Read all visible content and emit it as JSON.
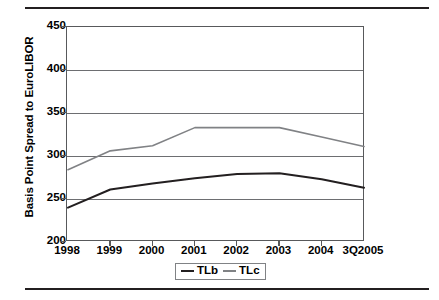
{
  "chart_data": {
    "type": "line",
    "title": "",
    "xlabel": "",
    "ylabel": "Basis Point Spread to EuroLIBOR",
    "categories": [
      "1998",
      "1999",
      "2000",
      "2001",
      "2002",
      "2003",
      "2004",
      "3Q2005"
    ],
    "yticks": [
      200,
      250,
      300,
      350,
      400,
      450
    ],
    "ylim": [
      200,
      450
    ],
    "grid": true,
    "legend_position": "bottom-center",
    "series": [
      {
        "name": "TLb",
        "color": "#231f20",
        "values": [
          240,
          261,
          268,
          274,
          279,
          280,
          273,
          263
        ]
      },
      {
        "name": "TLc",
        "color": "#808285",
        "values": [
          284,
          306,
          312,
          333,
          333,
          333,
          322,
          311
        ]
      }
    ]
  },
  "axis": {
    "y_title": "Basis Point Spread to EuroLIBOR",
    "y_tick_labels": [
      "450",
      "400",
      "350",
      "300",
      "250",
      "200"
    ],
    "x_tick_labels": [
      "1998",
      "1999",
      "2000",
      "2001",
      "2002",
      "2003",
      "2004",
      "3Q2005"
    ]
  },
  "legend": {
    "items": [
      {
        "label": "TLb",
        "color": "#231f20"
      },
      {
        "label": "TLc",
        "color": "#808285"
      }
    ]
  },
  "colors": {
    "series_tlb": "#231f20",
    "series_tlc": "#808285",
    "gridline": "#6d6e71",
    "axis": "#58595b",
    "rule": "#231f20",
    "background": "#ffffff"
  }
}
